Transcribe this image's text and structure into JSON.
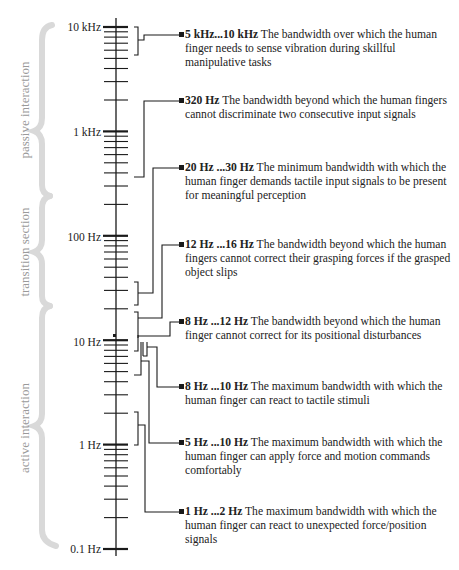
{
  "axis": {
    "scale": "log",
    "labels": [
      {
        "text": "10 kHz",
        "value": 10000
      },
      {
        "text": "1 kHz",
        "value": 1000
      },
      {
        "text": "100 Hz",
        "value": 100
      },
      {
        "text": "10 Hz",
        "value": 10
      },
      {
        "text": "1 Hz",
        "value": 1
      },
      {
        "text": "0.1 Hz",
        "value": 0.1
      }
    ]
  },
  "regions": [
    {
      "label": "passive interaction"
    },
    {
      "label": "transition section"
    },
    {
      "label": "active interaction"
    }
  ],
  "notes": [
    {
      "range": "5 kHz...10 kHz",
      "text": "The bandwidth over which the human finger needs to sense vibration during skillful manipulative tasks"
    },
    {
      "range": "320 Hz",
      "text": "The bandwidth beyond which the human fingers cannot discriminate two consecutive input signals"
    },
    {
      "range": "20 Hz ...30 Hz",
      "text": "The minimum bandwidth with which the human finger demands tactile input signals to be present for meaningful perception"
    },
    {
      "range": "12 Hz ...16 Hz",
      "text": "The bandwidth beyond which the human fingers cannot correct their grasping forces if the grasped object slips"
    },
    {
      "range": "8 Hz ...12 Hz",
      "text": "The bandwidth beyond which the human finger cannot correct for its positional disturbances"
    },
    {
      "range": "8 Hz ...10 Hz",
      "text": "The maximum bandwidth with which the human finger can react to tactile stimuli"
    },
    {
      "range": "5 Hz ...10 Hz",
      "text": "The maximum bandwidth with which the human finger can apply force and motion commands comfortably"
    },
    {
      "range": "1 Hz ...2 Hz",
      "text": "The maximum bandwidth with which the human finger can react to unexpected force/position signals"
    }
  ],
  "colors": {
    "line": "#1a1a1a",
    "brace": "#d6d6d6",
    "brace_text": "#9a9a9a"
  }
}
